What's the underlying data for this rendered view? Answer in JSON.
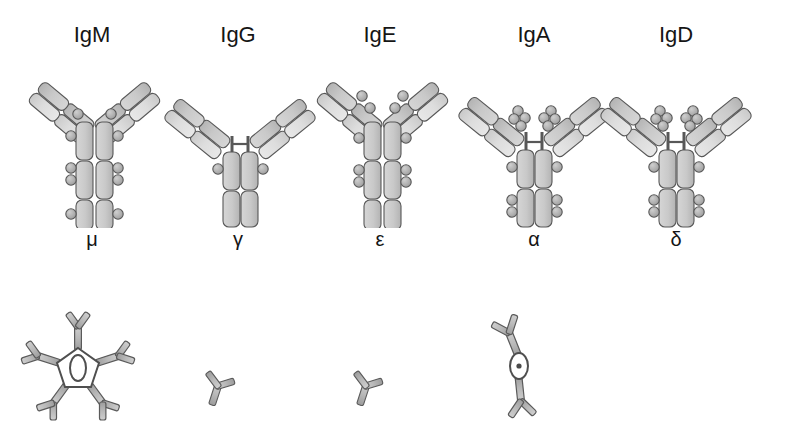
{
  "figure": {
    "background_color": "#ffffff",
    "outline_color": "#4d4d4d",
    "domain_fill_light": "#dcdcdc",
    "domain_fill_mid": "#c8c8c8",
    "domain_fill_dark": "#b4b4b4",
    "knob_fill": "#b0b0b0",
    "text_color": "#151515"
  },
  "rows": {
    "top_row_caption": "Monomer domain structure",
    "bottom_row_caption": "Secreted / native form"
  },
  "isotypes": [
    {
      "id": "igm",
      "class_label": "IgM",
      "heavy_chain_label": "μ",
      "heavy_chain_name": "mu",
      "ch_domains": 4,
      "hinge": false,
      "glycosylation_sites": 5,
      "native_form": "pentamer",
      "native_form_label": "pentamer with J chain",
      "class_label_x": 92,
      "class_label_y": 22,
      "chain_label_x": 92,
      "chain_label_y": 232,
      "monomer_x": 10,
      "monomer_y": 45,
      "poly_x": 8,
      "poly_y": 305
    },
    {
      "id": "igg",
      "class_label": "IgG",
      "heavy_chain_label": "γ",
      "heavy_chain_name": "gamma",
      "ch_domains": 3,
      "hinge": true,
      "glycosylation_sites": 1,
      "native_form": "monomer",
      "native_form_label": "monomer",
      "class_label_x": 238,
      "class_label_y": 22,
      "chain_label_x": 238,
      "chain_label_y": 232,
      "monomer_x": 158,
      "monomer_y": 45,
      "poly_x": 186,
      "poly_y": 355
    },
    {
      "id": "ige",
      "class_label": "IgE",
      "heavy_chain_label": "ε",
      "heavy_chain_name": "epsilon",
      "ch_domains": 4,
      "hinge": false,
      "glycosylation_sites": 6,
      "native_form": "monomer",
      "native_form_label": "monomer",
      "class_label_x": 380,
      "class_label_y": 22,
      "chain_label_x": 380,
      "chain_label_y": 232,
      "monomer_x": 298,
      "monomer_y": 45,
      "poly_x": 334,
      "poly_y": 355
    },
    {
      "id": "iga",
      "class_label": "IgA",
      "heavy_chain_label": "α",
      "heavy_chain_name": "alpha",
      "ch_domains": 3,
      "hinge": true,
      "glycosylation_sites": 7,
      "native_form": "dimer",
      "native_form_label": "dimer with J chain",
      "class_label_x": 534,
      "class_label_y": 22,
      "chain_label_x": 534,
      "chain_label_y": 232,
      "monomer_x": 454,
      "monomer_y": 45,
      "poly_x": 470,
      "poly_y": 312
    },
    {
      "id": "igd",
      "class_label": "IgD",
      "heavy_chain_label": "δ",
      "heavy_chain_name": "delta",
      "ch_domains": 3,
      "hinge": true,
      "glycosylation_sites": 7,
      "native_form": "none_shown",
      "native_form_label": "",
      "class_label_x": 676,
      "class_label_y": 22,
      "chain_label_x": 676,
      "chain_label_y": 232,
      "monomer_x": 596,
      "monomer_y": 45,
      "poly_x": 0,
      "poly_y": 0
    }
  ]
}
